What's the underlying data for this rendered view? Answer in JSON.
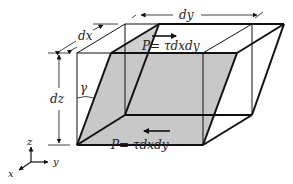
{
  "diagram": {
    "labels": {
      "dx": "dx",
      "dy": "dy",
      "dz": "dz",
      "gamma": "γ",
      "force_top": "P= τdxdy",
      "force_bottom": "P= τdxdy"
    },
    "axes": {
      "x": "x",
      "y": "y",
      "z": "z"
    },
    "colors": {
      "line": "#111111",
      "shade": "#c8c8c8",
      "text": "#222222"
    }
  }
}
